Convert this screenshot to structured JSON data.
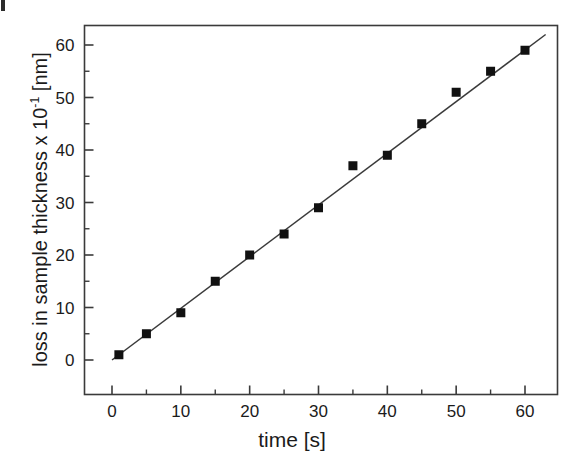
{
  "figure": {
    "background_color": "#ffffff",
    "artifact_present": true
  },
  "chart_data": {
    "type": "scatter",
    "title": "",
    "subtitle": "",
    "xlabel": "time [s]",
    "ylabel_text": "loss in sample thickness x 10",
    "ylabel_exponent": "-1",
    "ylabel_unit": " [nm]",
    "ylabel_full": "loss in sample thickness x 10-1 [nm]",
    "xlim": [
      -4,
      64
    ],
    "ylim": [
      -7,
      63
    ],
    "xticks": [
      0,
      10,
      20,
      30,
      40,
      50,
      60
    ],
    "xtick_labels": [
      "0",
      "10",
      "20",
      "30",
      "40",
      "50",
      "60"
    ],
    "x_minor_ticks": [
      5,
      15,
      25,
      35,
      45,
      55
    ],
    "yticks": [
      0,
      10,
      20,
      30,
      40,
      50,
      60
    ],
    "ytick_labels": [
      "0",
      "10",
      "20",
      "30",
      "40",
      "50",
      "60"
    ],
    "y_minor_ticks": [
      5,
      15,
      25,
      35,
      45,
      55
    ],
    "grid": false,
    "legend": false,
    "legend_position": "none",
    "marker": "filled-square",
    "marker_color": "#111111",
    "marker_size_px": 9,
    "line_color": "#3a3a3a",
    "frame_color": "#3a3a3a",
    "series": [
      {
        "name": "loss in sample thickness",
        "x": [
          1,
          5,
          10,
          15,
          20,
          25,
          30,
          35,
          40,
          45,
          50,
          55,
          60
        ],
        "values": [
          1,
          5,
          9,
          15,
          20,
          24,
          29,
          37,
          39,
          45,
          51,
          55,
          59
        ]
      }
    ],
    "fit_line": {
      "name": "linear fit",
      "x_start": 0,
      "y_start": 0,
      "x_end": 63,
      "y_end": 62,
      "slope": 0.984,
      "intercept": 0
    }
  }
}
